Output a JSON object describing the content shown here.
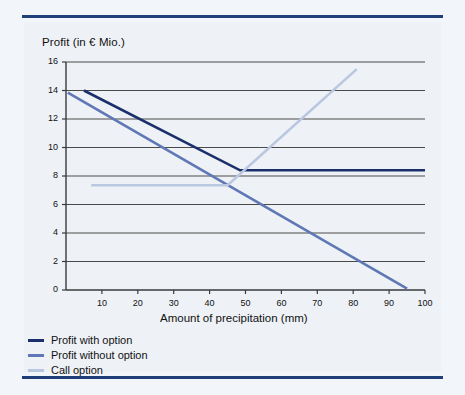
{
  "figure": {
    "background_color": "#eef2f7",
    "rule_color": "#1f3f7a"
  },
  "chart_data": {
    "type": "line",
    "title": "",
    "xlabel": "Amount of precipitation (mm)",
    "ylabel": "Profit (in € Mio.)",
    "xlim": [
      0,
      100
    ],
    "ylim": [
      0,
      16
    ],
    "xticks": [
      10,
      20,
      30,
      40,
      50,
      60,
      70,
      80,
      90,
      100
    ],
    "xtick_labels": [
      "10",
      "20",
      "30",
      "40",
      "50",
      "60",
      "70",
      "80",
      "90",
      "100"
    ],
    "yticks": [
      0,
      2,
      4,
      6,
      8,
      10,
      12,
      14,
      16
    ],
    "ytick_labels": [
      "0",
      "2",
      "4",
      "6",
      "8",
      "10",
      "12",
      "14",
      "16"
    ],
    "grid": "horizontal",
    "legend_position": "below-axes",
    "series": [
      {
        "name": "Profit with option",
        "color": "#1b2f6b",
        "width": 2.6,
        "points": [
          [
            5,
            14.0
          ],
          [
            48.5,
            8.4
          ],
          [
            100,
            8.4
          ]
        ]
      },
      {
        "name": "Profit without option",
        "color": "#5f78b5",
        "width": 2.6,
        "points": [
          [
            0.5,
            13.85
          ],
          [
            95,
            0.1
          ]
        ]
      },
      {
        "name": "Call option",
        "color": "#b9c7e0",
        "width": 2.6,
        "points": [
          [
            7,
            7.35
          ],
          [
            45,
            7.35
          ],
          [
            81,
            15.5
          ]
        ]
      }
    ]
  },
  "axis": {
    "ylabel_text": "Profit (in € Mio.)",
    "xlabel_text": "Amount of precipitation (mm)"
  },
  "legend": {
    "items": [
      {
        "label": "Profit with option",
        "color": "#1b2f6b"
      },
      {
        "label": "Profit without option",
        "color": "#5f78b5"
      },
      {
        "label": "Call option",
        "color": "#b9c7e0"
      }
    ]
  }
}
